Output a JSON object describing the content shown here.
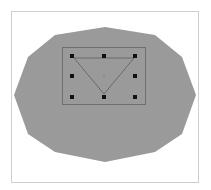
{
  "canvas": {
    "width": 211,
    "height": 190,
    "background": "#ffffff"
  },
  "frame": {
    "x": 11,
    "y": 11,
    "width": 188,
    "height": 172,
    "border_color": "#cfcfcf"
  },
  "shape": {
    "type": "polygon",
    "fill": "#9a9a9a",
    "points": [
      [
        105,
        27
      ],
      [
        155,
        35
      ],
      [
        182,
        57
      ],
      [
        196,
        95
      ],
      [
        182,
        134
      ],
      [
        155,
        152
      ],
      [
        105,
        162
      ],
      [
        55,
        152
      ],
      [
        28,
        134
      ],
      [
        14,
        95
      ],
      [
        28,
        57
      ],
      [
        55,
        35
      ]
    ]
  },
  "selection_box": {
    "x": 62,
    "y": 47,
    "width": 83,
    "height": 57,
    "stroke": "#6e6e6e"
  },
  "handles": {
    "size": 4,
    "color": "#111111",
    "positions": [
      [
        72,
        56
      ],
      [
        104,
        56
      ],
      [
        135,
        56
      ],
      [
        72,
        76
      ],
      [
        135,
        76
      ],
      [
        72,
        97
      ],
      [
        104,
        97
      ],
      [
        135,
        97
      ]
    ]
  },
  "triangle": {
    "points": [
      [
        74,
        58
      ],
      [
        134,
        58
      ],
      [
        104,
        94
      ]
    ],
    "stroke": "#6a6a6a"
  },
  "center_marker": {
    "x": 104,
    "y": 76,
    "color": "#8a8a8a"
  }
}
